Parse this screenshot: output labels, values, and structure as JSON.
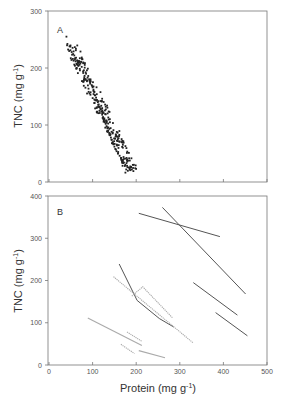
{
  "chart_data": [
    {
      "panel": "A",
      "type": "scatter",
      "xlabel": "",
      "ylabel": "TNC (mg g-1)",
      "ylabel_main": "TNC (mg g",
      "ylabel_sup": "-1",
      "ylabel_close": ")",
      "xlim": [
        0,
        500
      ],
      "ylim": [
        0,
        300
      ],
      "xticks": [
        0,
        100,
        200,
        300,
        400,
        500
      ],
      "yticks": [
        0,
        100,
        200,
        300
      ],
      "ytick_labels": [
        "0",
        "100",
        "200",
        "300"
      ],
      "grid": false,
      "description": "Dense negatively correlated point cloud of ~300 points from about (40, 255) down to (190, 20)",
      "trend": {
        "x_start": 40,
        "y_start": 255,
        "x_end": 190,
        "y_end": 20
      },
      "points_sample": [
        [
          40,
          255
        ],
        [
          52,
          228
        ],
        [
          58,
          222
        ],
        [
          62,
          218
        ],
        [
          68,
          210
        ],
        [
          72,
          208
        ],
        [
          75,
          202
        ],
        [
          80,
          196
        ],
        [
          85,
          190
        ],
        [
          90,
          186
        ],
        [
          92,
          180
        ],
        [
          95,
          176
        ],
        [
          98,
          170
        ],
        [
          100,
          166
        ],
        [
          102,
          162
        ],
        [
          104,
          158
        ],
        [
          106,
          152
        ],
        [
          108,
          148
        ],
        [
          110,
          144
        ],
        [
          112,
          140
        ],
        [
          114,
          136
        ],
        [
          116,
          132
        ],
        [
          118,
          128
        ],
        [
          120,
          124
        ],
        [
          122,
          118
        ],
        [
          124,
          114
        ],
        [
          126,
          110
        ],
        [
          128,
          106
        ],
        [
          130,
          102
        ],
        [
          132,
          98
        ],
        [
          134,
          94
        ],
        [
          136,
          90
        ],
        [
          138,
          86
        ],
        [
          140,
          82
        ],
        [
          142,
          78
        ],
        [
          144,
          74
        ],
        [
          146,
          70
        ],
        [
          148,
          66
        ],
        [
          150,
          62
        ],
        [
          152,
          58
        ],
        [
          155,
          54
        ],
        [
          158,
          50
        ],
        [
          162,
          46
        ],
        [
          165,
          42
        ],
        [
          168,
          38
        ],
        [
          172,
          34
        ],
        [
          175,
          30
        ],
        [
          180,
          26
        ],
        [
          185,
          22
        ],
        [
          190,
          22
        ]
      ]
    },
    {
      "panel": "B",
      "type": "line",
      "xlabel": "Protein (mg g-1)",
      "xlabel_main": "Protein (mg g",
      "xlabel_sup": "-1",
      "xlabel_close": ")",
      "ylabel": "TNC (mg g-1)",
      "ylabel_main": "TNC (mg g",
      "ylabel_sup": "-1",
      "ylabel_close": ")",
      "xlim": [
        0,
        500
      ],
      "ylim": [
        0,
        400
      ],
      "xticks": [
        0,
        100,
        200,
        300,
        400,
        500
      ],
      "xtick_labels": [
        "0",
        "100",
        "200",
        "300",
        "400",
        "500"
      ],
      "yticks": [
        0,
        100,
        200,
        300,
        400
      ],
      "ytick_labels": [
        "0",
        "100",
        "200",
        "300",
        "400"
      ],
      "grid": false,
      "series": [
        {
          "name": "line-1",
          "style": "dark-solid",
          "points": [
            [
              206,
              359
            ],
            [
              392,
              304
            ]
          ]
        },
        {
          "name": "line-2",
          "style": "dark-solid",
          "points": [
            [
              260,
              373
            ],
            [
              451,
              168
            ]
          ]
        },
        {
          "name": "line-3",
          "style": "dark-solid",
          "points": [
            [
              161,
              239
            ],
            [
              202,
              153
            ],
            [
              253,
              110
            ],
            [
              286,
              90
            ]
          ]
        },
        {
          "name": "line-4",
          "style": "dark-solid",
          "points": [
            [
              331,
              195
            ],
            [
              432,
              118
            ]
          ]
        },
        {
          "name": "line-5",
          "style": "dark-solid",
          "points": [
            [
              382,
              124
            ],
            [
              455,
              69
            ]
          ]
        },
        {
          "name": "line-6",
          "style": "light-dotted",
          "points": [
            [
              148,
              209
            ],
            [
              331,
              52
            ]
          ]
        },
        {
          "name": "line-7",
          "style": "light-dotted",
          "points": [
            [
              190,
              163
            ],
            [
              215,
              185
            ],
            [
              283,
              112
            ]
          ]
        },
        {
          "name": "line-8",
          "style": "light-solid",
          "points": [
            [
              89,
              111
            ],
            [
              213,
              46
            ]
          ]
        },
        {
          "name": "line-9",
          "style": "light-dotted",
          "points": [
            [
              179,
              78
            ],
            [
              213,
              56
            ]
          ]
        },
        {
          "name": "line-10",
          "style": "light-dotted",
          "points": [
            [
              165,
              49
            ],
            [
              196,
              27
            ]
          ]
        },
        {
          "name": "line-11",
          "style": "light-solid",
          "points": [
            [
              206,
              34
            ],
            [
              266,
              17
            ]
          ]
        }
      ]
    }
  ],
  "labels": {
    "panel_a": "A",
    "panel_b": "B"
  },
  "colors": {
    "dark_line": "#555555",
    "light_line": "#aaaaaa",
    "points": "#222222",
    "axis": "#666666"
  }
}
